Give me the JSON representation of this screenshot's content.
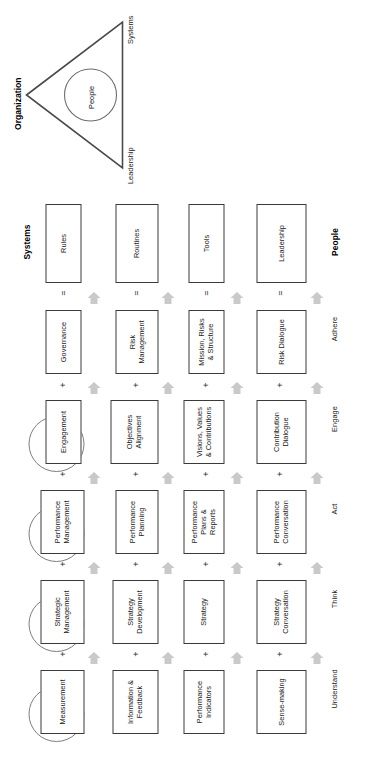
{
  "diagram": {
    "column_headers": {
      "left": "Systems",
      "right": "People"
    },
    "organization": {
      "title": "Organization",
      "center_label": "People",
      "side_labels": {
        "lower": "Leadership",
        "upper": "Systems"
      }
    },
    "rows": [
      {
        "circle": "",
        "boxes": [
          "Rules",
          "Routines",
          "Tools",
          "Leadership"
        ],
        "outcome": "",
        "connector_below": "=",
        "has_arrows": false
      },
      {
        "circle": "Maintain\nthe Focus",
        "boxes": [
          "Governance",
          "Risk\nManagement",
          "Mission, Risks\n& Structure",
          "Risk Dialogue"
        ],
        "outcome": "Adhere",
        "connector_below": "+",
        "has_arrows": true
      },
      {
        "circle": "",
        "boxes": [
          "Engagement",
          "Objectives\nAlignment",
          "Visions, Values\n& Contributions",
          "Contribution\nDialogue"
        ],
        "outcome": "Engage",
        "connector_below": "+",
        "has_arrows": true
      },
      {
        "circle": "Mobilize\nthe\nEnergy",
        "boxes": [
          "Performance\nManagement",
          "Performance\nPlanning",
          "Performance\nPlans &\nReports",
          "Performance\nConversation"
        ],
        "outcome": "Act",
        "connector_below": "+",
        "has_arrows": true
      },
      {
        "circle": "Move\nin One\nDirection",
        "boxes": [
          "Strategic\nManagement",
          "Strategy\nDevelopment",
          "Strategy",
          "Strategy\nConversation"
        ],
        "outcome": "Think",
        "connector_below": "+",
        "has_arrows": true
      },
      {
        "circle": "Know\nWith\nClarity",
        "boxes": [
          "Measurement",
          "Information &\nFeedback",
          "Performance\nIndicators",
          "Sense-making"
        ],
        "outcome": "Understand",
        "connector_below": "",
        "has_arrows": true
      }
    ],
    "colors": {
      "box_border": "#3a3a3a",
      "circle_border": "#7d7d7d",
      "arrow_fill": "#c9c9c9",
      "text": "#222222",
      "background": "#ffffff"
    }
  }
}
